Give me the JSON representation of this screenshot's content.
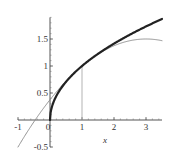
{
  "chart_data": {
    "type": "line",
    "title": "",
    "xlabel": "x",
    "ylabel": "",
    "xlim": [
      -1,
      3.5
    ],
    "ylim": [
      -0.5,
      1.9
    ],
    "grid": false,
    "legend": null,
    "x_ticks": [
      -1,
      0,
      1,
      2,
      3
    ],
    "x_tick_labels": [
      "-1",
      "0",
      "1",
      "2",
      "3"
    ],
    "y_ticks": [
      -0.5,
      0.5,
      1,
      1.5
    ],
    "y_tick_labels": [
      "-0.5",
      "0.5",
      "1",
      "1.5"
    ],
    "series": [
      {
        "name": "sqrt(x)",
        "style": "thick",
        "color": "#222222",
        "x": [
          0,
          0.01,
          0.05,
          0.1,
          0.2,
          0.3,
          0.5,
          0.75,
          1,
          1.5,
          2,
          2.5,
          3,
          3.5
        ],
        "values": [
          0,
          0.1,
          0.224,
          0.316,
          0.447,
          0.548,
          0.707,
          0.866,
          1,
          1.225,
          1.414,
          1.581,
          1.732,
          1.871
        ]
      },
      {
        "name": "quadratic Taylor polynomial at x=1",
        "style": "thin",
        "color": "#888888",
        "x": [
          -1,
          -0.5,
          0,
          0.5,
          1,
          1.5,
          2,
          2.5,
          3,
          3.5
        ],
        "values": [
          -0.5,
          -0.031,
          0.375,
          0.719,
          1,
          1.219,
          1.375,
          1.469,
          1.5,
          1.469
        ]
      },
      {
        "name": "vertical marker at x=1",
        "style": "thin",
        "color": "#aaaaaa",
        "x": [
          1,
          1
        ],
        "values": [
          0,
          1
        ]
      }
    ]
  },
  "axes": {
    "x_label": "x",
    "x_ticks": [
      "-1",
      "0",
      "1",
      "2",
      "3"
    ],
    "y_ticks": [
      "-0.5",
      "0.5",
      "1",
      "1.5"
    ]
  }
}
